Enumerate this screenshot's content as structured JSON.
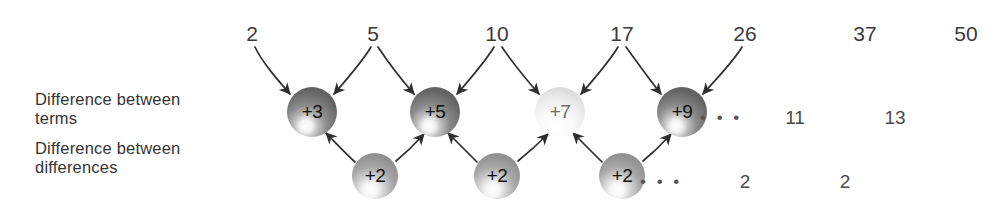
{
  "diagram": {
    "row_labels": {
      "terms": "Difference between\nterms",
      "differences": "Difference between\ndifferences"
    },
    "sequence_row": {
      "name": "terms",
      "values": [
        "2",
        "5",
        "10",
        "17",
        "26",
        "37",
        "50"
      ],
      "x": [
        252,
        373,
        497,
        622,
        745,
        865,
        966
      ],
      "y": 35
    },
    "first_differences": {
      "name": "difference-between-terms",
      "spheres": [
        {
          "label": "+3",
          "cx": 312,
          "cy": 112,
          "r": 25,
          "shade": "dark"
        },
        {
          "label": "+5",
          "cx": 435,
          "cy": 112,
          "r": 25,
          "shade": "dark"
        },
        {
          "label": "+7",
          "cx": 560,
          "cy": 112,
          "r": 25,
          "shade": "light"
        },
        {
          "label": "+9",
          "cx": 682,
          "cy": 112,
          "r": 25,
          "shade": "dark"
        }
      ],
      "ellipsis": "• • •",
      "ellipsis_x": 710,
      "ellipsis_y": 118,
      "tail_values": [
        "11",
        "13"
      ],
      "tail_x": [
        795,
        895
      ],
      "tail_y": 118
    },
    "second_differences": {
      "name": "difference-between-differences",
      "spheres": [
        {
          "label": "+2",
          "cx": 375,
          "cy": 176,
          "r": 23,
          "shade": "mid"
        },
        {
          "label": "+2",
          "cx": 497,
          "cy": 176,
          "r": 23,
          "shade": "mid"
        },
        {
          "label": "+2",
          "cx": 622,
          "cy": 176,
          "r": 23,
          "shade": "mid"
        }
      ],
      "ellipsis": "• • •",
      "ellipsis_x": 648,
      "ellipsis_y": 182,
      "tail_values": [
        "2",
        "2"
      ],
      "tail_x": [
        745,
        845
      ],
      "tail_y": 182
    },
    "colors": {
      "background": "#ffffff",
      "text": "#333333",
      "arrow": "#2f2f2f",
      "sphere_dark": "#6e6e6e",
      "sphere_mid": "#9a9a9a",
      "sphere_light": "#e8e8e8",
      "sphere_highlight": "#ffffff"
    }
  }
}
